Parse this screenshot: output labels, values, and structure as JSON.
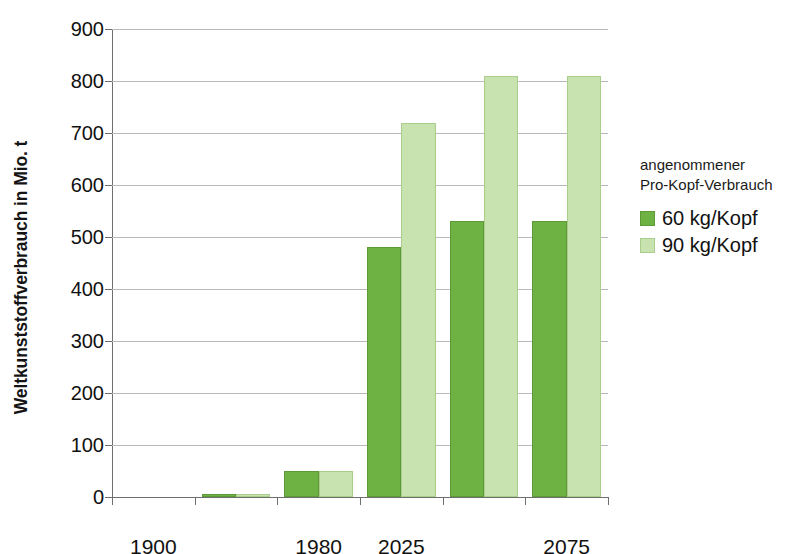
{
  "chart_data": {
    "type": "bar",
    "title": "",
    "xlabel": "",
    "ylabel": "Weltkunststoffverbrauch in Mio. t",
    "ylim": [
      0,
      900
    ],
    "ytick_step": 100,
    "yticks": [
      "0",
      "100",
      "200",
      "300",
      "400",
      "500",
      "600",
      "700",
      "800",
      "900"
    ],
    "grid": true,
    "legend_position": "right",
    "legend_title_lines": [
      "angenommener",
      "Pro-Kopf-Verbrauch"
    ],
    "categories": [
      "1900",
      "",
      "1980",
      "2025",
      "",
      "2075"
    ],
    "category_slots": 6,
    "visible_xtick_labels": [
      {
        "slot": 0,
        "label": "1900"
      },
      {
        "slot": 2,
        "label": "1980"
      },
      {
        "slot": 3,
        "label": "2025"
      },
      {
        "slot": 5,
        "label": "2075"
      }
    ],
    "series": [
      {
        "name": "60 kg/Kopf",
        "color": "#6fb244",
        "values": [
          0,
          5,
          50,
          480,
          530,
          530
        ]
      },
      {
        "name": "90 kg/Kopf",
        "color": "#c8e3af",
        "values": [
          0,
          5,
          50,
          720,
          810,
          810
        ]
      }
    ]
  },
  "colors": {
    "series_60": "#6fb244",
    "series_90": "#c8e3af",
    "axis": "#6e6e6e",
    "grid": "#b9b9b9",
    "text": "#111111",
    "background": "#ffffff"
  }
}
